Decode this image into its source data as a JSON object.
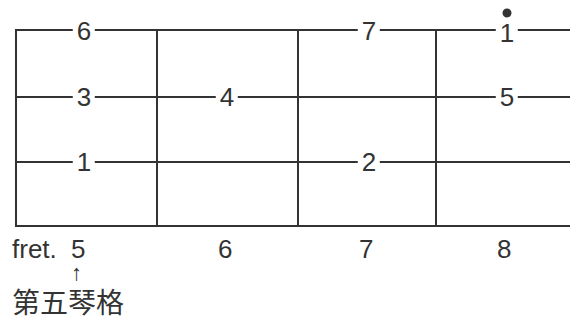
{
  "diagram": {
    "type": "fretboard",
    "strings": 4,
    "frets": [
      "5",
      "6",
      "7",
      "8"
    ],
    "fret_prefix": "fret.",
    "notes": [
      {
        "string": 1,
        "fret": "5",
        "label": "6"
      },
      {
        "string": 1,
        "fret": "7",
        "label": "7"
      },
      {
        "string": 1,
        "fret": "8",
        "label": "1",
        "high_octave_dot": true
      },
      {
        "string": 2,
        "fret": "5",
        "label": "3"
      },
      {
        "string": 2,
        "fret": "6",
        "label": "4"
      },
      {
        "string": 2,
        "fret": "8",
        "label": "5"
      },
      {
        "string": 3,
        "fret": "5",
        "label": "1"
      },
      {
        "string": 3,
        "fret": "7",
        "label": "2"
      }
    ],
    "arrow": "↑",
    "caption": "第五琴格"
  }
}
